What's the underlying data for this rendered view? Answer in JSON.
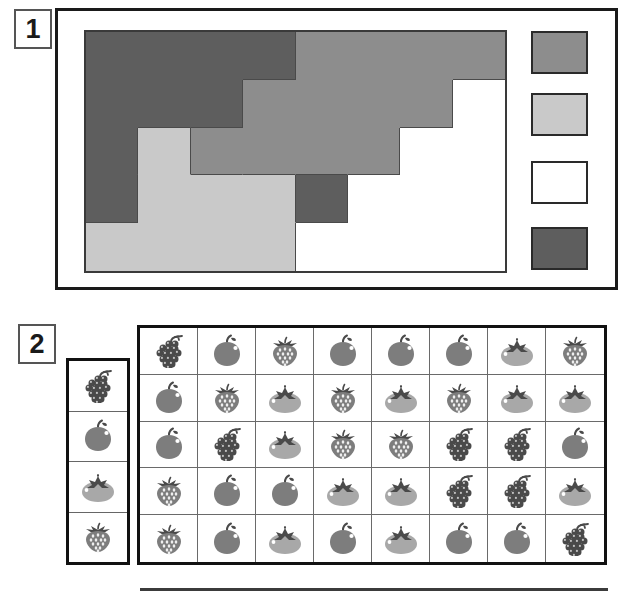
{
  "page": {
    "panels": [
      {
        "number": "1",
        "name": "shaded-grid-panel"
      },
      {
        "number": "2",
        "name": "fruit-grid-panel"
      }
    ]
  },
  "colors": {
    "dark_gray": "#5e5e5e",
    "medium_gray": "#8d8d8d",
    "light_gray": "#c9c9c9",
    "white": "#ffffff",
    "border_dark": "#1a1a1a",
    "grid_line": "#4a4a4a",
    "fruit_dark": "#4a4a4a",
    "fruit_mid": "#7d7d7d",
    "fruit_light": "#a8a8a8"
  },
  "panel1": {
    "label": "1",
    "grid": {
      "columns": 8,
      "rows": 5,
      "cells": [
        {
          "row": 1,
          "col": 1,
          "colspan": 1,
          "rowspan": 1,
          "shade": "dark_gray"
        },
        {
          "row": 1,
          "col": 2,
          "colspan": 1,
          "rowspan": 1,
          "shade": "dark_gray"
        },
        {
          "row": 1,
          "col": 3,
          "colspan": 1,
          "rowspan": 1,
          "shade": "dark_gray"
        },
        {
          "row": 1,
          "col": 4,
          "colspan": 1,
          "rowspan": 1,
          "shade": "dark_gray"
        },
        {
          "row": 1,
          "col": 5,
          "colspan": 1,
          "rowspan": 1,
          "shade": "medium_gray"
        },
        {
          "row": 1,
          "col": 6,
          "colspan": 1,
          "rowspan": 1,
          "shade": "medium_gray"
        },
        {
          "row": 1,
          "col": 7,
          "colspan": 1,
          "rowspan": 2,
          "shade": "medium_gray"
        },
        {
          "row": 1,
          "col": 8,
          "colspan": 1,
          "rowspan": 1,
          "shade": "medium_gray"
        },
        {
          "row": 2,
          "col": 1,
          "colspan": 1,
          "rowspan": 2,
          "shade": "dark_gray"
        },
        {
          "row": 2,
          "col": 2,
          "colspan": 1,
          "rowspan": 1,
          "shade": "dark_gray"
        },
        {
          "row": 2,
          "col": 3,
          "colspan": 1,
          "rowspan": 1,
          "shade": "dark_gray"
        },
        {
          "row": 2,
          "col": 4,
          "colspan": 2,
          "rowspan": 2,
          "shade": "medium_gray"
        },
        {
          "row": 2,
          "col": 6,
          "colspan": 1,
          "rowspan": 1,
          "shade": "medium_gray"
        },
        {
          "row": 2,
          "col": 8,
          "colspan": 2,
          "rowspan": 1,
          "shade": "white"
        },
        {
          "row": 3,
          "col": 2,
          "colspan": 1,
          "rowspan": 1,
          "shade": "light_gray"
        },
        {
          "row": 3,
          "col": 3,
          "colspan": 1,
          "rowspan": 1,
          "shade": "medium_gray"
        },
        {
          "row": 3,
          "col": 6,
          "colspan": 1,
          "rowspan": 1,
          "shade": "medium_gray"
        },
        {
          "row": 3,
          "col": 7,
          "colspan": 1,
          "rowspan": 1,
          "shade": "white"
        },
        {
          "row": 3,
          "col": 8,
          "colspan": 1,
          "rowspan": 1,
          "shade": "white"
        },
        {
          "row": 4,
          "col": 1,
          "colspan": 1,
          "rowspan": 1,
          "shade": "dark_gray"
        },
        {
          "row": 4,
          "col": 2,
          "colspan": 1,
          "rowspan": 1,
          "shade": "light_gray"
        },
        {
          "row": 4,
          "col": 3,
          "colspan": 2,
          "rowspan": 1,
          "shade": "light_gray"
        },
        {
          "row": 4,
          "col": 5,
          "colspan": 1,
          "rowspan": 1,
          "shade": "dark_gray"
        },
        {
          "row": 4,
          "col": 6,
          "colspan": 1,
          "rowspan": 2,
          "shade": "white"
        },
        {
          "row": 4,
          "col": 7,
          "colspan": 1,
          "rowspan": 1,
          "shade": "white"
        },
        {
          "row": 4,
          "col": 8,
          "colspan": 1,
          "rowspan": 1,
          "shade": "white"
        },
        {
          "row": 5,
          "col": 1,
          "colspan": 1,
          "rowspan": 2,
          "shade": "light_gray"
        },
        {
          "row": 5,
          "col": 2,
          "colspan": 1,
          "rowspan": 1,
          "shade": "light_gray"
        },
        {
          "row": 5,
          "col": 3,
          "colspan": 1,
          "rowspan": 1,
          "shade": "light_gray"
        },
        {
          "row": 5,
          "col": 4,
          "colspan": 1,
          "rowspan": 1,
          "shade": "light_gray"
        },
        {
          "row": 5,
          "col": 5,
          "colspan": 1,
          "rowspan": 1,
          "shade": "white"
        },
        {
          "row": 5,
          "col": 7,
          "colspan": 1,
          "rowspan": 1,
          "shade": "white"
        },
        {
          "row": 5,
          "col": 8,
          "colspan": 1,
          "rowspan": 1,
          "shade": "white"
        },
        {
          "row": 6,
          "col": 2,
          "colspan": 1,
          "rowspan": 1,
          "shade": "light_gray"
        },
        {
          "row": 6,
          "col": 3,
          "colspan": 1,
          "rowspan": 1,
          "shade": "light_gray"
        },
        {
          "row": 6,
          "col": 4,
          "colspan": 1,
          "rowspan": 1,
          "shade": "white"
        },
        {
          "row": 6,
          "col": 5,
          "colspan": 1,
          "rowspan": 1,
          "shade": "white"
        },
        {
          "row": 6,
          "col": 6,
          "colspan": 1,
          "rowspan": 1,
          "shade": "white"
        },
        {
          "row": 6,
          "col": 7,
          "colspan": 1,
          "rowspan": 1,
          "shade": "white"
        },
        {
          "row": 6,
          "col": 8,
          "colspan": 1,
          "rowspan": 1,
          "shade": "white"
        }
      ],
      "shade_matrix": [
        [
          "dark_gray",
          "dark_gray",
          "dark_gray",
          "dark_gray",
          "medium_gray",
          "medium_gray",
          "medium_gray",
          "medium_gray"
        ],
        [
          "dark_gray",
          "dark_gray",
          "dark_gray",
          "medium_gray",
          "medium_gray",
          "medium_gray",
          "medium_gray",
          "white"
        ],
        [
          "dark_gray",
          "light_gray",
          "medium_gray",
          "medium_gray",
          "medium_gray",
          "medium_gray",
          "white",
          "white"
        ],
        [
          "dark_gray",
          "light_gray",
          "light_gray",
          "light_gray",
          "dark_gray",
          "white",
          "white",
          "white"
        ],
        [
          "light_gray",
          "light_gray",
          "light_gray",
          "light_gray",
          "white",
          "white",
          "white",
          "white"
        ]
      ]
    },
    "legend": {
      "name": "shade-legend",
      "swatches": [
        {
          "shade": "medium_gray",
          "order": 1
        },
        {
          "shade": "light_gray",
          "order": 2
        },
        {
          "shade": "white",
          "order": 3
        },
        {
          "shade": "dark_gray",
          "order": 4
        }
      ]
    }
  },
  "panel2": {
    "label": "2",
    "key": {
      "name": "fruit-key",
      "items": [
        "grapes",
        "apple",
        "persimmon",
        "strawberry"
      ]
    },
    "grid": {
      "columns": 8,
      "rows": 5,
      "fruit_matrix": [
        [
          "grapes",
          "apple",
          "strawberry",
          "apple",
          "apple",
          "apple",
          "persimmon",
          "strawberry"
        ],
        [
          "apple",
          "strawberry",
          "persimmon",
          "strawberry",
          "persimmon",
          "strawberry",
          "persimmon",
          "persimmon"
        ],
        [
          "apple",
          "grapes",
          "persimmon",
          "strawberry",
          "strawberry",
          "grapes",
          "grapes",
          "apple"
        ],
        [
          "strawberry",
          "apple",
          "apple",
          "persimmon",
          "persimmon",
          "grapes",
          "grapes",
          "persimmon"
        ],
        [
          "strawberry",
          "apple",
          "persimmon",
          "apple",
          "persimmon",
          "apple",
          "apple",
          "grapes"
        ]
      ]
    }
  },
  "footer": {
    "rule": "horizontal-divider"
  }
}
